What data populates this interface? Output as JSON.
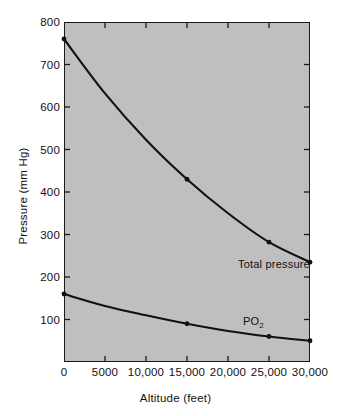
{
  "chart_data": {
    "type": "line",
    "title": "",
    "xlabel": "Altitude (feet)",
    "ylabel": "Pressure (mm Hg)",
    "xlim": [
      0,
      30000
    ],
    "ylim": [
      0,
      800
    ],
    "grid": false,
    "legend_position": "inline-annotation",
    "xticks": [
      0,
      5000,
      10000,
      15000,
      20000,
      25000,
      30000
    ],
    "xtick_labels": [
      "0",
      "5000",
      "10,000",
      "15,000",
      "20,000",
      "25,000",
      "30,000"
    ],
    "yticks": [
      100,
      200,
      300,
      400,
      500,
      600,
      700,
      800
    ],
    "ytick_labels": [
      "100",
      "200",
      "300",
      "400",
      "500",
      "600",
      "700",
      "800"
    ],
    "series": [
      {
        "name": "Total pressure",
        "x": [
          0,
          5000,
          10000,
          15000,
          20000,
          25000,
          30000
        ],
        "values": [
          760,
          632,
          523,
          430,
          350,
          282,
          235
        ],
        "markers_at": [
          0,
          15000,
          25000,
          30000
        ],
        "color": "#111111"
      },
      {
        "name": "PO2",
        "x": [
          0,
          5000,
          10000,
          15000,
          20000,
          25000,
          30000
        ],
        "values": [
          160,
          132,
          110,
          90,
          73,
          60,
          50
        ],
        "markers_at": [
          0,
          15000,
          25000,
          30000
        ],
        "color": "#111111"
      }
    ],
    "annotations": [
      {
        "text": "Total pressure",
        "x": 20500,
        "y": 300
      },
      {
        "text": "PO",
        "subscript": "2",
        "x": 23000,
        "y": 115
      }
    ]
  },
  "style": {
    "plot_background": "#bfbfbf",
    "page_background": "#ffffff",
    "axis_color": "#1a1a1a",
    "line_color": "#111111"
  }
}
